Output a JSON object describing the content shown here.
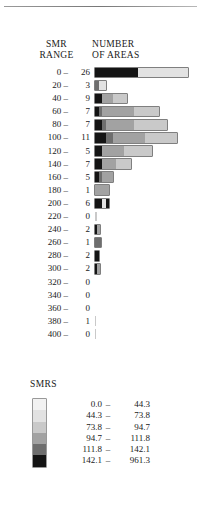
{
  "figure": {
    "headers": {
      "smr_range_line1": "SMR",
      "smr_range_line2": "RANGE",
      "number_line1": "NUMBER",
      "number_line2": "OF AREAS"
    },
    "legend_title": "SMRS"
  },
  "chart_data": {
    "type": "bar",
    "orientation": "horizontal",
    "title": "",
    "xlabel": "NUMBER OF AREAS",
    "ylabel": "SMR RANGE",
    "grid": false,
    "legend_position": "below",
    "categories": [
      "0 –",
      "20 –",
      "40 –",
      "60 –",
      "80 –",
      "100 –",
      "120 –",
      "140 –",
      "160 –",
      "180 –",
      "200 –",
      "220 –",
      "240 –",
      "260 –",
      "280 –",
      "300 –",
      "320 –",
      "340 –",
      "360 –",
      "380 –",
      "400 –"
    ],
    "values": [
      26,
      3,
      9,
      7,
      7,
      11,
      5,
      7,
      5,
      1,
      6,
      0,
      2,
      1,
      2,
      2,
      0,
      0,
      0,
      1,
      0
    ],
    "xlim": [
      0,
      26
    ],
    "shade_classes": [
      "s1",
      "s2",
      "s3",
      "s4",
      "s5",
      "s6"
    ],
    "rows": [
      {
        "range": "0 –",
        "count": "26",
        "segments": [
          {
            "shade": "s6",
            "value": 12
          },
          {
            "shade": "s2",
            "value": 14
          }
        ]
      },
      {
        "range": "20 –",
        "count": "3",
        "segments": [
          {
            "shade": "s5",
            "value": 1
          },
          {
            "shade": "s2",
            "value": 2
          }
        ]
      },
      {
        "range": "40 –",
        "count": "9",
        "segments": [
          {
            "shade": "s6",
            "value": 2
          },
          {
            "shade": "s4",
            "value": 3
          },
          {
            "shade": "s3",
            "value": 4
          }
        ]
      },
      {
        "range": "60 –",
        "count": "7",
        "segments": [
          {
            "shade": "s6",
            "value": 1
          },
          {
            "shade": "s5",
            "value": 1
          },
          {
            "shade": "s4",
            "value": 9
          },
          {
            "shade": "s3",
            "value": 7
          }
        ]
      },
      {
        "range": "80 –",
        "count": "7",
        "segments": [
          {
            "shade": "s6",
            "value": 2
          },
          {
            "shade": "s5",
            "value": 1
          },
          {
            "shade": "s4",
            "value": 8
          },
          {
            "shade": "s3",
            "value": 9
          }
        ]
      },
      {
        "range": "100 –",
        "count": "11",
        "segments": [
          {
            "shade": "s6",
            "value": 3
          },
          {
            "shade": "s5",
            "value": 2
          },
          {
            "shade": "s4",
            "value": 9
          },
          {
            "shade": "s3",
            "value": 9
          }
        ]
      },
      {
        "range": "120 –",
        "count": "5",
        "segments": [
          {
            "shade": "s6",
            "value": 2
          },
          {
            "shade": "s4",
            "value": 6
          },
          {
            "shade": "s3",
            "value": 8
          }
        ]
      },
      {
        "range": "140 –",
        "count": "7",
        "segments": [
          {
            "shade": "s6",
            "value": 2
          },
          {
            "shade": "s4",
            "value": 4
          },
          {
            "shade": "s3",
            "value": 4
          }
        ]
      },
      {
        "range": "160 –",
        "count": "5",
        "segments": [
          {
            "shade": "s6",
            "value": 1
          },
          {
            "shade": "s5",
            "value": 1
          },
          {
            "shade": "s4",
            "value": 3
          }
        ]
      },
      {
        "range": "180 –",
        "count": "1",
        "segments": [
          {
            "shade": "s4",
            "value": 4
          }
        ]
      },
      {
        "range": "200 –",
        "count": "6",
        "segments": [
          {
            "shade": "s6",
            "value": 2
          },
          {
            "shade": "s2",
            "value": 1
          },
          {
            "shade": "s6",
            "value": 1
          }
        ]
      },
      {
        "range": "220 –",
        "count": "0",
        "segments": [
          {
            "shade": "s3",
            "value": 0.6
          }
        ]
      },
      {
        "range": "240 –",
        "count": "2",
        "segments": [
          {
            "shade": "s6",
            "value": 0.5
          },
          {
            "shade": "s4",
            "value": 1
          }
        ]
      },
      {
        "range": "260 –",
        "count": "1",
        "segments": [
          {
            "shade": "s5",
            "value": 1.6
          }
        ]
      },
      {
        "range": "280 –",
        "count": "2",
        "segments": [
          {
            "shade": "s6",
            "value": 1.1
          }
        ]
      },
      {
        "range": "300 –",
        "count": "2",
        "segments": [
          {
            "shade": "s6",
            "value": 0.6
          },
          {
            "shade": "s4",
            "value": 0.8
          }
        ]
      },
      {
        "range": "320 –",
        "count": "0",
        "segments": []
      },
      {
        "range": "340 –",
        "count": "0",
        "segments": []
      },
      {
        "range": "360 –",
        "count": "0",
        "segments": []
      },
      {
        "range": "380 –",
        "count": "1",
        "segments": [
          {
            "shade": "s3",
            "value": 0.35
          }
        ]
      },
      {
        "range": "400 –",
        "count": "0",
        "segments": [
          {
            "shade": "s3",
            "value": 0.35
          }
        ]
      }
    ],
    "legend_entries": [
      {
        "shade": "s1",
        "low": "0.0",
        "dash": "–",
        "high": "44.3"
      },
      {
        "shade": "s2",
        "low": "44.3",
        "dash": "–",
        "high": "73.8"
      },
      {
        "shade": "s3",
        "low": "73.8",
        "dash": "–",
        "high": "94.7"
      },
      {
        "shade": "s4",
        "low": "94.7",
        "dash": "–",
        "high": "111.8"
      },
      {
        "shade": "s5",
        "low": "111.8",
        "dash": "–",
        "high": "142.1"
      },
      {
        "shade": "s6",
        "low": "142.1",
        "dash": "–",
        "high": "961.3"
      }
    ]
  }
}
